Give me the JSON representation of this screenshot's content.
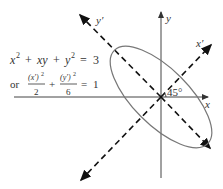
{
  "diagram": {
    "axes": {
      "x_label": "x",
      "y_label": "y",
      "x_prime_label": "x′",
      "y_prime_label": "y′"
    },
    "angle_label": "45°",
    "equation": {
      "line1": {
        "x": "x",
        "x_exp": "2",
        "plus1": "+",
        "xy": "xy",
        "plus2": "+",
        "y": "y",
        "y_exp": "2",
        "equals": "=",
        "rhs": "3"
      },
      "line2": {
        "prefix": "or",
        "frac1_num": "(x′)",
        "frac1_num_exp": "2",
        "frac1_den": "2",
        "plus": "+",
        "frac2_num": "(y′)",
        "frac2_num_exp": "2",
        "frac2_den": "6",
        "equals": "=",
        "rhs": "1"
      }
    },
    "colors": {
      "axis": "#444444",
      "dashed_axis": "#222222",
      "ellipse": "#777777",
      "text": "#333333"
    }
  }
}
